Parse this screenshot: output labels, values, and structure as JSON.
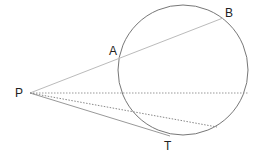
{
  "diagram": {
    "labels": {
      "P": "P",
      "A": "A",
      "B": "B",
      "T": "T"
    },
    "colors": {
      "circle": "#777777",
      "secant": "#bbbbbb",
      "tangent": "#999999",
      "dotted": "#999999",
      "text": "#222222"
    }
  }
}
